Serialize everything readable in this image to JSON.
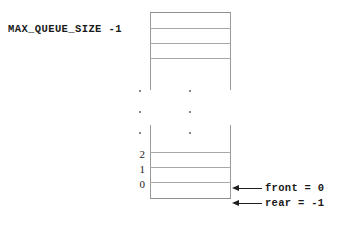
{
  "diagram": {
    "title_label": "MAX_QUEUE_SIZE -1",
    "array": {
      "top_cells_count": 3,
      "bottom_cells_count": 3,
      "ellipsis_dot_count": 3,
      "line_color": "#a8a8a8",
      "frame_color": "#9a9a9a",
      "background": "#ffffff"
    },
    "index_labels": [
      {
        "value": "2"
      },
      {
        "value": "1"
      },
      {
        "value": "0"
      }
    ],
    "pointers": [
      {
        "name": "front-pointer",
        "label": "front = 0"
      },
      {
        "name": "rear-pointer",
        "label": "rear = -1"
      }
    ]
  }
}
